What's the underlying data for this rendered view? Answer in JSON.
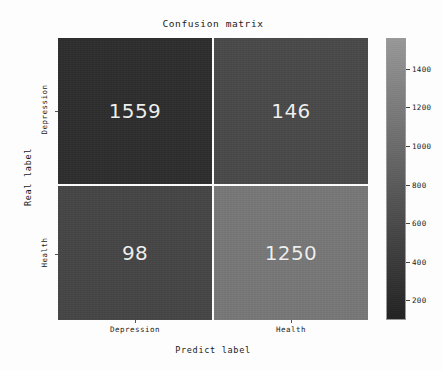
{
  "chart_data": {
    "type": "heatmap",
    "title": "Confusion matrix",
    "xlabel": "Predict label",
    "ylabel": "Real label",
    "x_categories": [
      "Depression",
      "Health"
    ],
    "y_categories": [
      "Depression",
      "Health"
    ],
    "matrix": [
      [
        1559,
        146
      ],
      [
        98,
        1250
      ]
    ],
    "cells": [
      {
        "row": 0,
        "col": 0,
        "row_label": "Depression",
        "col_label": "Depression",
        "value": "1559",
        "color": "#2e2e2e"
      },
      {
        "row": 0,
        "col": 1,
        "row_label": "Depression",
        "col_label": "Health",
        "value": "146",
        "color": "#4a4a4a"
      },
      {
        "row": 1,
        "col": 0,
        "row_label": "Health",
        "col_label": "Depression",
        "value": "98",
        "color": "#464646"
      },
      {
        "row": 1,
        "col": 1,
        "row_label": "Health",
        "col_label": "Health",
        "value": "1250",
        "color": "#787878"
      }
    ],
    "colormap": "gray",
    "colorbar": {
      "ticks": [
        "1400",
        "1200",
        "1000",
        "800",
        "600",
        "400",
        "200"
      ],
      "tick_values": [
        1400,
        1200,
        1000,
        800,
        600,
        400,
        200
      ],
      "vmin": 98,
      "vmax": 1559,
      "orientation": "vertical"
    },
    "grid": false,
    "legend": "colorbar-right",
    "value_text_color": "#f2f2f2"
  },
  "colors": {
    "background": "#fdfdfd",
    "gridline": "#f5f5f5",
    "axis_text": "#1a1a1a",
    "cell_dark": "#2e2e2e",
    "cell_light": "#787878"
  }
}
